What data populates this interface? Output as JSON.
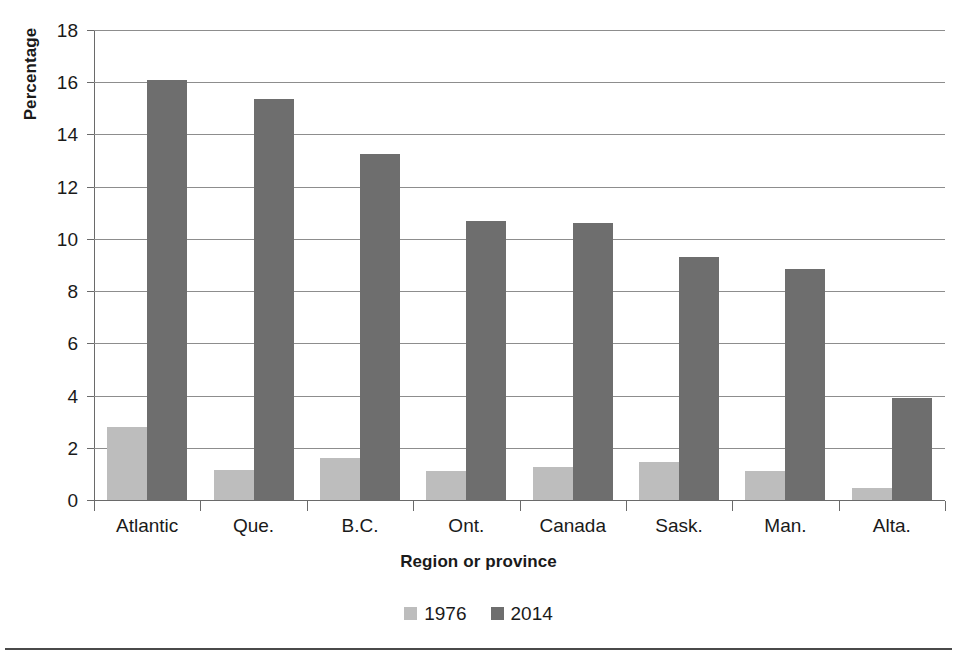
{
  "chart_data": {
    "type": "bar",
    "title": "",
    "xlabel": "Region or province",
    "ylabel": "Percentage",
    "categories": [
      "Atlantic",
      "Que.",
      "B.C.",
      "Ont.",
      "Canada",
      "Sask.",
      "Man.",
      "Alta."
    ],
    "series": [
      {
        "name": "1976",
        "color": "#bdbdbd",
        "values": [
          2.8,
          1.15,
          1.6,
          1.1,
          1.25,
          1.45,
          1.1,
          0.45
        ]
      },
      {
        "name": "2014",
        "color": "#6e6e6e",
        "values": [
          16.1,
          15.35,
          13.25,
          10.7,
          10.6,
          9.3,
          8.85,
          3.9
        ]
      }
    ],
    "ylim": [
      0,
      18
    ],
    "ytick_labels": [
      "18",
      "16",
      "14",
      "12",
      "10",
      "8",
      "6",
      "4",
      "2",
      "0"
    ],
    "ytick_values": [
      18,
      16,
      14,
      12,
      10,
      8,
      6,
      4,
      2,
      0
    ],
    "ytick_step": 2,
    "grid": true,
    "legend_position": "bottom",
    "legend": [
      {
        "label": "1976",
        "swatch": "legend-swatch-1976",
        "color": "#bdbdbd"
      },
      {
        "label": "2014",
        "swatch": "legend-swatch-2014",
        "color": "#6e6e6e"
      }
    ]
  },
  "colors": {
    "series_1976": "#bdbdbd",
    "series_2014": "#6e6e6e",
    "gridline": "#8d8d8d",
    "axis": "#6a6a6a",
    "text": "#1a1a1a",
    "rule": "#4a4a4a",
    "background": "#ffffff"
  }
}
